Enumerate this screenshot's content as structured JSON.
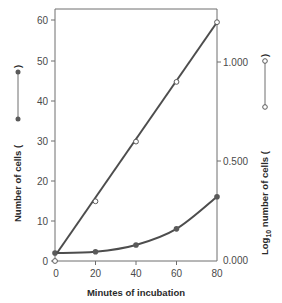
{
  "chart_data": {
    "type": "line",
    "title": "",
    "xlabel": "Minutes of incubation",
    "ylabel": "Number of cells",
    "ylabel_right": "Log10 number of cells",
    "x": [
      0,
      20,
      40,
      60,
      80
    ],
    "xlim": [
      0,
      80
    ],
    "ylim": [
      0,
      60
    ],
    "ylim_right": [
      0.0,
      1.2
    ],
    "x_ticks": [
      "0",
      "20",
      "40",
      "60",
      "80"
    ],
    "y_ticks": [
      "0",
      "10",
      "20",
      "30",
      "40",
      "50",
      "60"
    ],
    "y_ticks_right": [
      "0.000",
      "0.500",
      "1.000"
    ],
    "grid": false,
    "legend_position": "inline with axis titles",
    "series": [
      {
        "name": "Number of cells",
        "axis": "left",
        "marker": "filled circle",
        "values": [
          2,
          2.3,
          4,
          8,
          16
        ]
      },
      {
        "name": "Log10 number of cells",
        "axis": "right",
        "marker": "open circle",
        "values": [
          0.0,
          0.3,
          0.6,
          0.9,
          1.2
        ]
      }
    ],
    "colors": {
      "line": "#4d4d4d",
      "axis": "#6e6e6e"
    }
  },
  "labels": {
    "x_title": "Minutes of incubation",
    "y_left_title": "Number of cells (",
    "y_left_close": ")",
    "y_right_prefix": "Log",
    "y_right_sub": "10",
    "y_right_rest": " number of cells (",
    "y_right_close": ")",
    "x_ticks": [
      "0",
      "20",
      "40",
      "60",
      "80"
    ],
    "y_ticks": [
      "0",
      "10",
      "20",
      "30",
      "40",
      "50",
      "60"
    ],
    "y_ticks_right": [
      "0.000",
      "0.500",
      "1.000"
    ]
  }
}
